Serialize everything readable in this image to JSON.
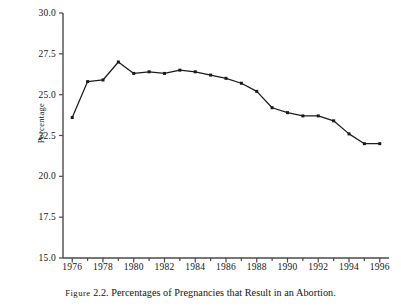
{
  "figure": {
    "caption_prefix": "Figure",
    "caption_number": "2.2.",
    "caption_text": "Percentages of Pregnancies that Result in an Abortion."
  },
  "chart_data": {
    "type": "line",
    "title": "",
    "xlabel": "",
    "ylabel": "Percentage",
    "xlim": [
      1975.4,
      1996.6
    ],
    "ylim": [
      15.0,
      30.0
    ],
    "grid": false,
    "legend": "none",
    "marker": "filled-square",
    "line_color": "#1a1a1a",
    "y_ticks": [
      "30.0",
      "27.5",
      "25.0",
      "22.5",
      "20.0",
      "17.5",
      "15.0"
    ],
    "y_tick_values": [
      30.0,
      27.5,
      25.0,
      22.5,
      20.0,
      17.5,
      15.0
    ],
    "x_ticks": [
      "1976",
      "1978",
      "1980",
      "1982",
      "1984",
      "1986",
      "1988",
      "1990",
      "1992",
      "1994",
      "1996"
    ],
    "x_tick_values": [
      1976,
      1978,
      1980,
      1982,
      1984,
      1986,
      1988,
      1990,
      1992,
      1994,
      1996
    ],
    "x_minor_tick_values": [
      1977,
      1979,
      1981,
      1983,
      1985,
      1987,
      1989,
      1991,
      1993,
      1995
    ],
    "x": [
      1976,
      1977,
      1978,
      1979,
      1980,
      1981,
      1982,
      1983,
      1984,
      1985,
      1986,
      1987,
      1988,
      1989,
      1990,
      1991,
      1992,
      1993,
      1994,
      1995,
      1996
    ],
    "values": [
      23.6,
      25.8,
      25.9,
      27.0,
      26.3,
      26.4,
      26.3,
      26.5,
      26.4,
      26.2,
      26.0,
      25.7,
      25.2,
      24.2,
      23.9,
      23.7,
      23.7,
      23.4,
      22.6,
      22.0,
      22.0
    ]
  }
}
